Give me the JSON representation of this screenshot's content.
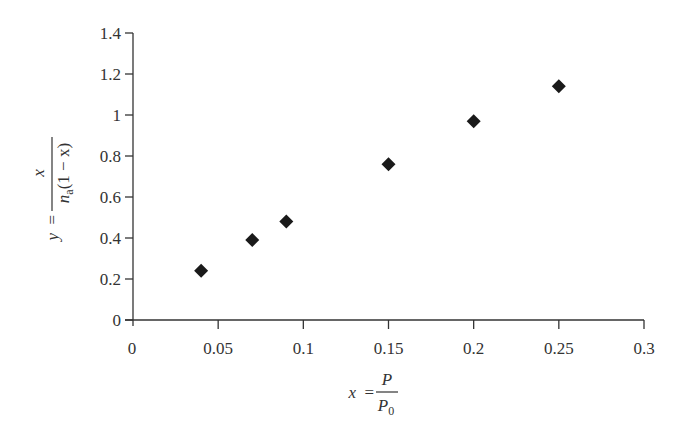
{
  "chart_data": {
    "type": "scatter",
    "title": "",
    "xlabel": "x = P / P0",
    "ylabel": "y = x / (n_a(1 − x))",
    "xlim": [
      0,
      0.3
    ],
    "ylim": [
      0,
      1.4
    ],
    "grid": false,
    "legend": null,
    "marker": "diamond",
    "marker_color": "#1a1a1a",
    "x_ticks": [
      0,
      0.05,
      0.1,
      0.15,
      0.2,
      0.25,
      0.3
    ],
    "x_tick_labels": [
      "0",
      "0.05",
      "0.1",
      "0.15",
      "0.2",
      "0.25",
      "0.3"
    ],
    "y_ticks": [
      0,
      0.2,
      0.4,
      0.6,
      0.8,
      1.0,
      1.2,
      1.4
    ],
    "y_tick_labels": [
      "0",
      "0.2",
      "0.4",
      "0.6",
      "0.8",
      "1",
      "1.2",
      "1.4"
    ],
    "series": [
      {
        "name": "data",
        "x": [
          0.04,
          0.07,
          0.09,
          0.15,
          0.2,
          0.25
        ],
        "y": [
          0.24,
          0.39,
          0.48,
          0.76,
          0.97,
          1.14
        ]
      }
    ]
  },
  "labels": {
    "x_axis": {
      "lhs": "x",
      "eq": "=",
      "num": "P",
      "den": "P",
      "den_sub": "0"
    },
    "y_axis": {
      "lhs": "y",
      "eq": "=",
      "num": "x",
      "den_n": "n",
      "den_sub": "a",
      "den_rest": "(1 − x)"
    }
  }
}
